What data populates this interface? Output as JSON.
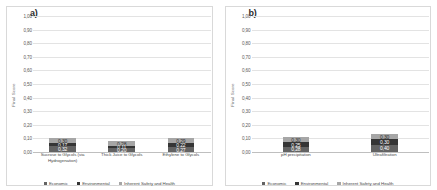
{
  "figure": {
    "panels": [
      {
        "label": "a)",
        "ylabel": "Final Score"
      },
      {
        "label": "b)",
        "ylabel": "Final Score"
      }
    ]
  },
  "legend": {
    "items": [
      {
        "label": "Economic",
        "color": "#636363"
      },
      {
        "label": "Environmental",
        "color": "#353535"
      },
      {
        "label": "Inherent Safety and Health",
        "color": "#a6a6a6"
      }
    ]
  },
  "yaxis": {
    "ticks": [
      "0,00",
      "0,10",
      "0,20",
      "0,30",
      "0,40",
      "0,50",
      "0,60",
      "0,70",
      "0,80",
      "0,90",
      "1,00"
    ],
    "min": 0,
    "max": 1
  },
  "chart_data": [
    {
      "type": "bar",
      "title": "a)",
      "stacked": true,
      "xlabel": "",
      "ylabel": "Final Score",
      "ylim": [
        0,
        1
      ],
      "ytick_labels": [
        "0,00",
        "0,10",
        "0,20",
        "0,30",
        "0,40",
        "0,50",
        "0,60",
        "0,70",
        "0,80",
        "0,90",
        "1,00"
      ],
      "grid": true,
      "legend_position": "bottom",
      "categories": [
        "Sucrose to Glycols (via Hydrogenation)",
        "Thick Juice to Glycols",
        "Ethylene to Glycols"
      ],
      "series": [
        {
          "name": "Economic",
          "color": "#636363",
          "values": [
            0.32,
            0.2,
            0.27
          ],
          "labels": [
            "0,32",
            "0,20",
            "0,27"
          ]
        },
        {
          "name": "Environmental",
          "color": "#353535",
          "values": [
            0.17,
            0.11,
            0.22
          ],
          "labels": [
            "0,17",
            "0,11",
            "0,22"
          ]
        },
        {
          "name": "Inherent Safety and Health",
          "color": "#a6a6a6",
          "values": [
            0.3,
            0.28,
            0.29
          ],
          "labels": [
            "0,30",
            "0,28",
            "0,29"
          ]
        }
      ],
      "totals": [
        0.79,
        0.59,
        0.78
      ]
    },
    {
      "type": "bar",
      "title": "b)",
      "stacked": true,
      "xlabel": "",
      "ylabel": "Final Score",
      "ylim": [
        0,
        1
      ],
      "ytick_labels": [
        "0,00",
        "0,10",
        "0,20",
        "0,30",
        "0,40",
        "0,50",
        "0,60",
        "0,70",
        "0,80",
        "0,90",
        "1,00"
      ],
      "grid": true,
      "legend_position": "bottom",
      "categories": [
        "pH precipitation",
        "Ultrafiltration"
      ],
      "series": [
        {
          "name": "Economic",
          "color": "#636363",
          "values": [
            0.28,
            0.4
          ],
          "labels": [
            "0,28",
            "0,40"
          ]
        },
        {
          "name": "Environmental",
          "color": "#353535",
          "values": [
            0.25,
            0.3
          ],
          "labels": [
            "0,25",
            "0,30"
          ]
        },
        {
          "name": "Inherent Safety and Health",
          "color": "#a6a6a6",
          "values": [
            0.3,
            0.3
          ],
          "labels": [
            "0,30",
            "0,30"
          ]
        }
      ],
      "totals": [
        0.83,
        1.0
      ]
    }
  ]
}
